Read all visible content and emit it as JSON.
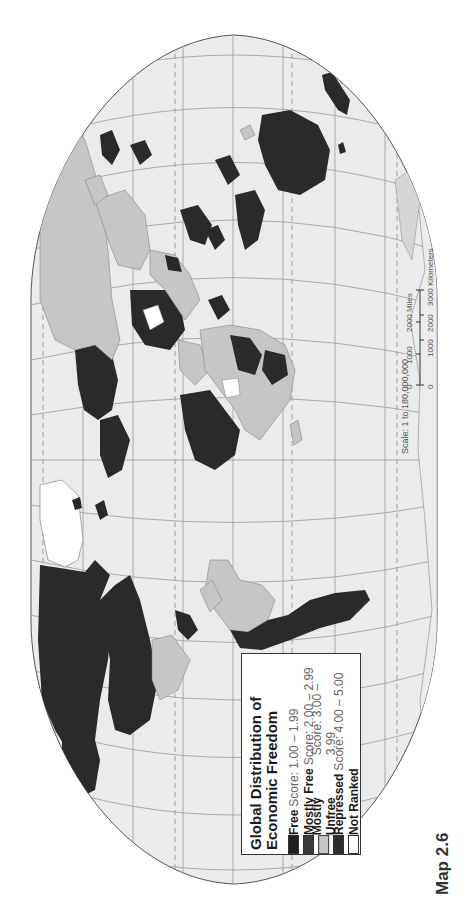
{
  "map": {
    "label": "Map 2.6",
    "orientation": "rotated 90° counter-clockwise",
    "colors": {
      "ocean": "#ebebeb",
      "graticule": "#9a9a9a",
      "border": "#555555",
      "page": "#ffffff"
    }
  },
  "legend": {
    "title_line1": "Global Distribution of",
    "title_line2": "Economic Freedom",
    "items": [
      {
        "name": "Free",
        "score": "Score: 1.00 – 1.99",
        "color": "#1e1e1e"
      },
      {
        "name": "Mostly Free",
        "score": "Score: 2.00 – 2.99",
        "color": "#3a3a3a"
      },
      {
        "name": "Mostly Unfree",
        "score": "Score: 3.00 – 3.99",
        "color": "#c6c6c6"
      },
      {
        "name": "Repressed",
        "score": "Score: 4.00 – 5.00",
        "color": "#2c2c2c"
      },
      {
        "name": "Not Ranked",
        "score": "",
        "color": "#ffffff"
      }
    ]
  },
  "scale": {
    "text": "Scale: 1 to 180,000,000",
    "miles_ticks": [
      "0",
      "1000",
      "2000 Miles"
    ],
    "km_ticks": [
      "0",
      "1000",
      "2000",
      "3000 Kilometers"
    ]
  }
}
